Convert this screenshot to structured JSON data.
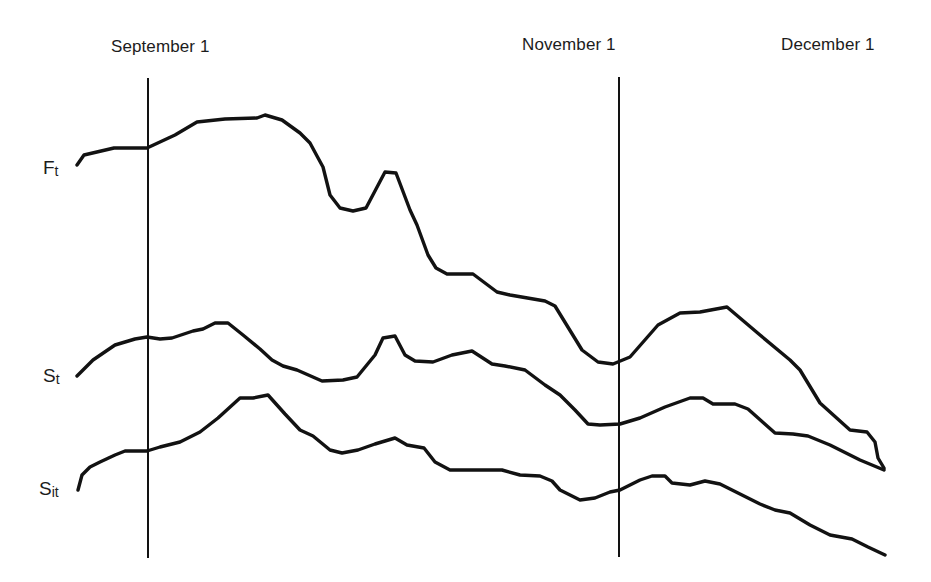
{
  "chart_data": {
    "type": "line",
    "title": "",
    "xlabel": "",
    "ylabel": "",
    "grid": false,
    "legend": "none (series labelled inline at left end of each curve)",
    "date_markers": [
      {
        "label": "September 1",
        "x": 148,
        "has_line": true
      },
      {
        "label": "November 1",
        "x": 619,
        "has_line": true
      },
      {
        "label": "December 1",
        "x": 884,
        "has_line": false
      }
    ],
    "series": [
      {
        "name": "F_t",
        "label_main": "F",
        "label_sub": "t",
        "points": [
          [
            77,
            165
          ],
          [
            84,
            155
          ],
          [
            114,
            148
          ],
          [
            147,
            148
          ],
          [
            175,
            135
          ],
          [
            197,
            122
          ],
          [
            225,
            119
          ],
          [
            257,
            118
          ],
          [
            265,
            115
          ],
          [
            282,
            120
          ],
          [
            300,
            133
          ],
          [
            310,
            143
          ],
          [
            317,
            156
          ],
          [
            323,
            167
          ],
          [
            330,
            195
          ],
          [
            340,
            208
          ],
          [
            353,
            211
          ],
          [
            366,
            208
          ],
          [
            385,
            172
          ],
          [
            396,
            173
          ],
          [
            410,
            210
          ],
          [
            417,
            225
          ],
          [
            428,
            255
          ],
          [
            436,
            268
          ],
          [
            447,
            274
          ],
          [
            473,
            274
          ],
          [
            497,
            292
          ],
          [
            510,
            295
          ],
          [
            545,
            301
          ],
          [
            555,
            306
          ],
          [
            582,
            350
          ],
          [
            598,
            362
          ],
          [
            613,
            364
          ],
          [
            630,
            357
          ],
          [
            658,
            325
          ],
          [
            680,
            313
          ],
          [
            700,
            312
          ],
          [
            727,
            307
          ],
          [
            760,
            335
          ],
          [
            790,
            360
          ],
          [
            800,
            370
          ],
          [
            820,
            403
          ],
          [
            850,
            430
          ],
          [
            867,
            432
          ],
          [
            875,
            442
          ],
          [
            878,
            458
          ],
          [
            884,
            468
          ]
        ]
      },
      {
        "name": "S_t",
        "label_main": "S",
        "label_sub": "t",
        "points": [
          [
            77,
            376
          ],
          [
            93,
            360
          ],
          [
            115,
            345
          ],
          [
            135,
            339
          ],
          [
            147,
            337
          ],
          [
            160,
            339
          ],
          [
            172,
            338
          ],
          [
            193,
            331
          ],
          [
            203,
            329
          ],
          [
            215,
            323
          ],
          [
            228,
            323
          ],
          [
            243,
            335
          ],
          [
            260,
            349
          ],
          [
            272,
            360
          ],
          [
            283,
            366
          ],
          [
            297,
            370
          ],
          [
            322,
            381
          ],
          [
            343,
            380
          ],
          [
            357,
            377
          ],
          [
            375,
            355
          ],
          [
            383,
            338
          ],
          [
            395,
            336
          ],
          [
            405,
            355
          ],
          [
            415,
            361
          ],
          [
            433,
            362
          ],
          [
            452,
            355
          ],
          [
            472,
            351
          ],
          [
            492,
            364
          ],
          [
            505,
            366
          ],
          [
            525,
            370
          ],
          [
            545,
            385
          ],
          [
            560,
            395
          ],
          [
            575,
            410
          ],
          [
            588,
            424
          ],
          [
            600,
            425
          ],
          [
            620,
            424
          ],
          [
            640,
            418
          ],
          [
            665,
            407
          ],
          [
            690,
            398
          ],
          [
            703,
            398
          ],
          [
            713,
            404
          ],
          [
            735,
            404
          ],
          [
            748,
            409
          ],
          [
            775,
            433
          ],
          [
            793,
            434
          ],
          [
            808,
            436
          ],
          [
            830,
            445
          ],
          [
            860,
            460
          ],
          [
            884,
            470
          ]
        ]
      },
      {
        "name": "S_it",
        "label_main": "S",
        "label_sub": "it",
        "points": [
          [
            78,
            490
          ],
          [
            82,
            475
          ],
          [
            90,
            467
          ],
          [
            100,
            462
          ],
          [
            115,
            455
          ],
          [
            125,
            451
          ],
          [
            147,
            451
          ],
          [
            160,
            447
          ],
          [
            180,
            442
          ],
          [
            200,
            432
          ],
          [
            218,
            418
          ],
          [
            240,
            398
          ],
          [
            253,
            398
          ],
          [
            268,
            395
          ],
          [
            285,
            414
          ],
          [
            300,
            430
          ],
          [
            313,
            436
          ],
          [
            330,
            450
          ],
          [
            342,
            453
          ],
          [
            358,
            450
          ],
          [
            375,
            444
          ],
          [
            395,
            438
          ],
          [
            407,
            445
          ],
          [
            424,
            448
          ],
          [
            435,
            462
          ],
          [
            450,
            470
          ],
          [
            480,
            470
          ],
          [
            502,
            470
          ],
          [
            520,
            475
          ],
          [
            540,
            476
          ],
          [
            552,
            481
          ],
          [
            560,
            490
          ],
          [
            580,
            500
          ],
          [
            595,
            498
          ],
          [
            610,
            492
          ],
          [
            620,
            490
          ],
          [
            640,
            480
          ],
          [
            652,
            476
          ],
          [
            665,
            476
          ],
          [
            672,
            483
          ],
          [
            690,
            485
          ],
          [
            705,
            481
          ],
          [
            720,
            484
          ],
          [
            760,
            504
          ],
          [
            775,
            510
          ],
          [
            790,
            513
          ],
          [
            810,
            525
          ],
          [
            830,
            535
          ],
          [
            852,
            539
          ],
          [
            868,
            547
          ],
          [
            885,
            555
          ]
        ]
      }
    ],
    "note": "Schematic time-series diagram; no numeric y-axis. Points are pixel coordinates (x right, y down) within a 931x582 canvas."
  },
  "labels": {
    "september": "September 1",
    "november": "November 1",
    "december": "December 1",
    "ft_main": "F",
    "ft_sub": "t",
    "st_main": "S",
    "st_sub": "t",
    "sit_main": "S",
    "sit_sub": "it"
  },
  "colors": {
    "ink": "#121212",
    "background": "#ffffff"
  }
}
